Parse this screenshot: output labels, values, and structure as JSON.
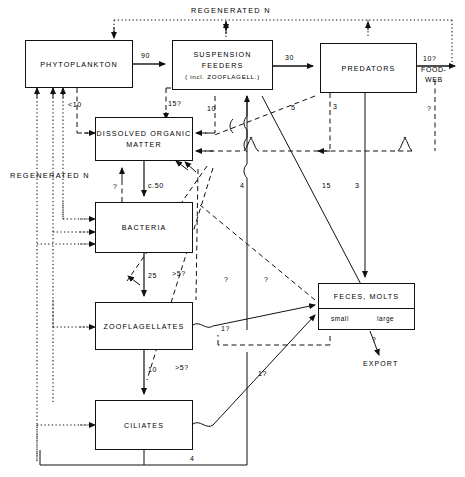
{
  "figure": {
    "title_top": "REGENERATED N",
    "title_left": "REGENERATED N"
  },
  "boxes": {
    "phytoplankton": {
      "label": "PHYTOPLANKTON"
    },
    "suspension_feeders": {
      "line1": "SUSPENSION",
      "line2": "FEEDERS",
      "line3": "( incl. ZOOFLAGELL.)"
    },
    "predators": {
      "label": "PREDATORS"
    },
    "dissolved_organic_matter": {
      "line1": "DISSOLVED ORGANIC",
      "line2": "MATTER"
    },
    "bacteria": {
      "label": "BACTERIA"
    },
    "zooflagellates": {
      "label": "ZOOFLAGELLATES"
    },
    "ciliates": {
      "label": "CILIATES"
    },
    "feces_molts": {
      "label": "FECES, MOLTS",
      "sub_left": "small",
      "sub_right": "large"
    }
  },
  "endpoints": {
    "food_web_line1": "FOOD-",
    "food_web_line2": "WEB",
    "export": "EXPORT"
  },
  "flows": [
    {
      "name": "phyto-to-suspension",
      "value": "90"
    },
    {
      "name": "suspension-to-predators",
      "value": "30"
    },
    {
      "name": "predators-to-foodweb",
      "value": "10?"
    },
    {
      "name": "phyto-to-dom",
      "value": "<10"
    },
    {
      "name": "suspension-to-dom",
      "value": "15?"
    },
    {
      "name": "suspension-to-dom-2",
      "value": "10"
    },
    {
      "name": "dom-to-bacteria",
      "value": "c.50"
    },
    {
      "name": "bacteria-to-dom",
      "value": "?"
    },
    {
      "name": "bacteria-to-zooflagellates",
      "value": "25"
    },
    {
      "name": "zooflagellates-to-dom",
      "value": ">5?"
    },
    {
      "name": "zooflagellates-to-ciliates",
      "value": "10"
    },
    {
      "name": "ciliates-to-dom",
      "value": ">5?"
    },
    {
      "name": "suspension-diag-5",
      "value": "5"
    },
    {
      "name": "predators-dashed-3",
      "value": "3"
    },
    {
      "name": "suspension-to-feces-15",
      "value": "15"
    },
    {
      "name": "predators-to-feces-3",
      "value": "3"
    },
    {
      "name": "feces-to-export",
      "value": "?"
    },
    {
      "name": "foodweb-return",
      "value": "?"
    },
    {
      "name": "vertical-4",
      "value": "4"
    },
    {
      "name": "zooflagellates-to-feces",
      "value": "1?"
    },
    {
      "name": "ciliates-to-feces",
      "value": "1?"
    },
    {
      "name": "feces-small-dashed",
      "value": "?"
    },
    {
      "name": "feces-large-dashed",
      "value": "?"
    },
    {
      "name": "ciliates-bottom-4",
      "value": "4"
    }
  ]
}
